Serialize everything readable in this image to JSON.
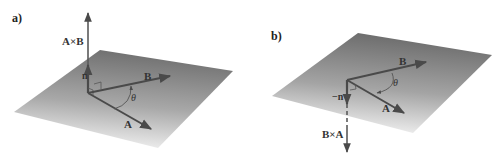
{
  "figure": {
    "panels": [
      {
        "id": "a",
        "label": "a)",
        "vectors": {
          "A": "A",
          "B": "B",
          "cross": "A×B",
          "normal": "n"
        },
        "angle_label": "θ",
        "cross_direction": "up"
      },
      {
        "id": "b",
        "label": "b)",
        "vectors": {
          "A": "A",
          "B": "B",
          "cross": "B×A",
          "normal": "−n"
        },
        "angle_label": "θ",
        "cross_direction": "down"
      }
    ],
    "colors": {
      "plane_dark": "#6e6e6e",
      "plane_light": "#f2f2f2",
      "vector": "#4a4a4a"
    }
  }
}
